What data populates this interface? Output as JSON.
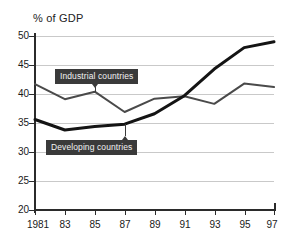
{
  "chart_data": {
    "type": "line",
    "title": "% of GDP",
    "xlabel": "",
    "ylabel": "",
    "ylim": [
      20,
      50
    ],
    "yticks": [
      20,
      25,
      30,
      35,
      40,
      45,
      50
    ],
    "grid": true,
    "legend_position": "inline-annotation",
    "x": [
      1981,
      1983,
      1985,
      1987,
      1989,
      1991,
      1993,
      1995,
      1997
    ],
    "categories": [
      "1981",
      "83",
      "85",
      "87",
      "89",
      "91",
      "93",
      "95",
      "97"
    ],
    "series": [
      {
        "name": "Industrial countries",
        "color": "#4a4a4a",
        "width": 2,
        "values": [
          41.7,
          39.1,
          40.4,
          36.9,
          39.2,
          39.6,
          38.3,
          41.8,
          41.2
        ]
      },
      {
        "name": "Developing countries",
        "color": "#141414",
        "width": 3,
        "values": [
          35.6,
          33.8,
          34.4,
          34.8,
          36.6,
          39.7,
          44.3,
          48.0,
          49.0
        ]
      }
    ],
    "annotations": [
      {
        "label": "Industrial countries",
        "points_to_series": "Industrial countries",
        "points_to_x": 1985
      },
      {
        "label": "Developing countries",
        "points_to_series": "Developing countries",
        "points_to_x": 1987
      }
    ]
  },
  "axis": {
    "y_labels": [
      "50",
      "45",
      "40",
      "35",
      "30",
      "25",
      "20"
    ],
    "x_labels": [
      "1981",
      "83",
      "85",
      "87",
      "89",
      "91",
      "93",
      "95",
      "97"
    ]
  }
}
